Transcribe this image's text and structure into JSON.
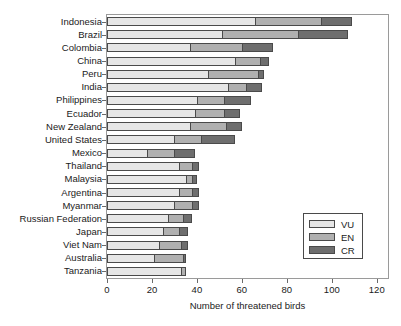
{
  "chart_data": {
    "type": "bar",
    "orientation": "horizontal",
    "stacked": true,
    "title": "",
    "xlabel": "Number of threatened birds",
    "ylabel": "",
    "xlim": [
      0,
      125
    ],
    "ylim": null,
    "grid": false,
    "legend_position": "lower right",
    "xticks": [
      0,
      20,
      40,
      60,
      80,
      100,
      120
    ],
    "xticklabels": [
      "0",
      "20",
      "40",
      "60",
      "80",
      "100",
      "120"
    ],
    "categories": [
      "Indonesia",
      "Brazil",
      "Colombia",
      "China",
      "Peru",
      "India",
      "Philippines",
      "Ecuador",
      "New Zealand",
      "United States",
      "Mexico",
      "Thailand",
      "Malaysia",
      "Argentina",
      "Myanmar",
      "Russian Federation",
      "Japan",
      "Viet Nam",
      "Australia",
      "Tanzania"
    ],
    "series": [
      {
        "name": "VU",
        "color": "#e6e6e6",
        "values": [
          66,
          51,
          37,
          57,
          45,
          54,
          40,
          39,
          37,
          30,
          18,
          32,
          35,
          32,
          30,
          27,
          25,
          23,
          21,
          33
        ]
      },
      {
        "name": "EN",
        "color": "#b0b0b0",
        "values": [
          29,
          34,
          23,
          11,
          22,
          8,
          12,
          13,
          16,
          12,
          12,
          6,
          3,
          6,
          8,
          7,
          7,
          10,
          13,
          2
        ]
      },
      {
        "name": "CR",
        "color": "#6e6e6e",
        "values": [
          14,
          22,
          14,
          4,
          3,
          7,
          12,
          7,
          7,
          15,
          9,
          3,
          2,
          3,
          3,
          4,
          4,
          3,
          1,
          0
        ]
      }
    ],
    "totals": [
      109,
      107,
      74,
      72,
      70,
      69,
      64,
      59,
      60,
      57,
      39,
      41,
      40,
      41,
      41,
      38,
      36,
      36,
      35,
      35
    ]
  },
  "legend": {
    "entries": [
      {
        "label": "VU",
        "color": "#e6e6e6"
      },
      {
        "label": "EN",
        "color": "#b0b0b0"
      },
      {
        "label": "CR",
        "color": "#6e6e6e"
      }
    ]
  }
}
